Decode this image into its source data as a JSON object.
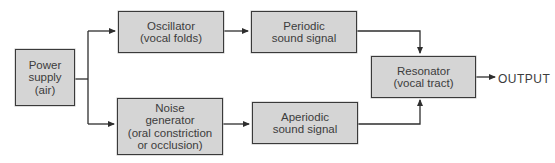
{
  "diagram": {
    "nodes": {
      "power_supply": {
        "lines": [
          "Power",
          "supply",
          "(air)"
        ]
      },
      "oscillator": {
        "lines": [
          "Oscillator",
          "(vocal folds)"
        ]
      },
      "noise_generator": {
        "lines": [
          "Noise",
          "generator",
          "(oral constriction",
          "or occlusion)"
        ]
      },
      "periodic_signal": {
        "lines": [
          "Periodic",
          "sound signal"
        ]
      },
      "aperiodic_signal": {
        "lines": [
          "Aperiodic",
          "sound signal"
        ]
      },
      "resonator": {
        "lines": [
          "Resonator",
          "(vocal tract)"
        ]
      }
    },
    "output_label": "OUTPUT",
    "edges": [
      {
        "from": "power_supply",
        "to": "oscillator"
      },
      {
        "from": "power_supply",
        "to": "noise_generator"
      },
      {
        "from": "oscillator",
        "to": "periodic_signal"
      },
      {
        "from": "noise_generator",
        "to": "aperiodic_signal"
      },
      {
        "from": "periodic_signal",
        "to": "resonator"
      },
      {
        "from": "aperiodic_signal",
        "to": "resonator"
      },
      {
        "from": "resonator",
        "to": "output"
      }
    ],
    "colors": {
      "box_fill": "#d5d5d5",
      "box_border": "#3a3a3a",
      "line": "#2e2e2e",
      "text": "#3c3c3c"
    }
  }
}
